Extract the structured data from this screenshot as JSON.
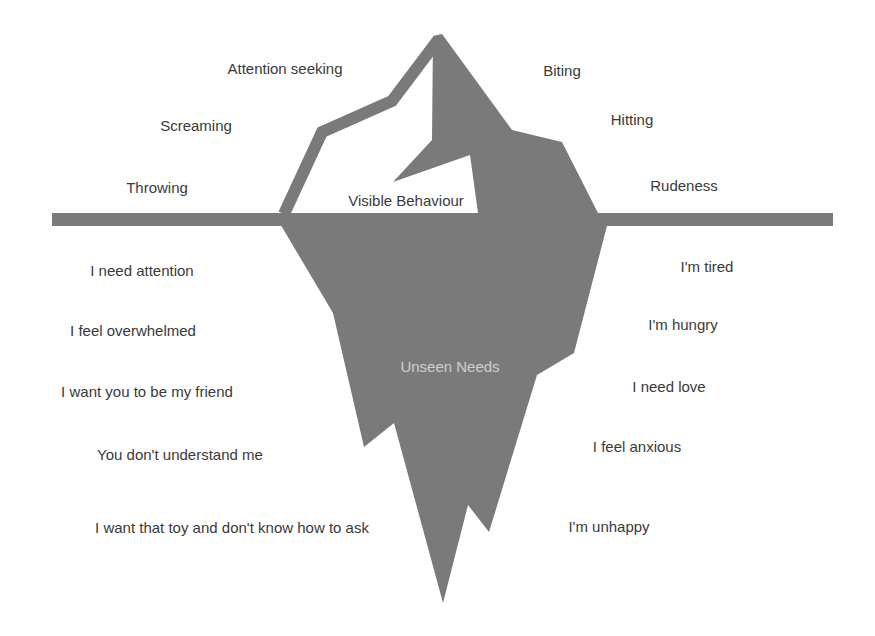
{
  "diagram": {
    "type": "iceberg",
    "colors": {
      "iceberg": "#7a7a7a",
      "waterline": "#7a7a7a",
      "text": "#3a3a3a",
      "unseen_text": "#cfcfcf",
      "background": "#ffffff"
    },
    "above_label": "Visible Behaviour",
    "below_label": "Unseen Needs",
    "visible_behaviours": {
      "left": [
        {
          "text": "Attention seeking",
          "x": 285,
          "y": 60
        },
        {
          "text": "Screaming",
          "x": 196,
          "y": 117
        },
        {
          "text": "Throwing",
          "x": 157,
          "y": 179
        }
      ],
      "right": [
        {
          "text": "Biting",
          "x": 562,
          "y": 62
        },
        {
          "text": "Hitting",
          "x": 632,
          "y": 111
        },
        {
          "text": "Rudeness",
          "x": 684,
          "y": 177
        }
      ]
    },
    "unseen_needs": {
      "left": [
        {
          "text": "I need attention",
          "x": 142,
          "y": 262
        },
        {
          "text": "I feel overwhelmed",
          "x": 133,
          "y": 322
        },
        {
          "text": "I want you to be my friend",
          "x": 147,
          "y": 383
        },
        {
          "text": "You don't understand me",
          "x": 180,
          "y": 446
        },
        {
          "text": "I want that toy and don't know how to ask",
          "x": 232,
          "y": 519
        }
      ],
      "right": [
        {
          "text": "I'm tired",
          "x": 707,
          "y": 258
        },
        {
          "text": "I'm hungry",
          "x": 683,
          "y": 316
        },
        {
          "text": "I need love",
          "x": 669,
          "y": 378
        },
        {
          "text": "I feel anxious",
          "x": 637,
          "y": 438
        },
        {
          "text": "I'm unhappy",
          "x": 609,
          "y": 518
        }
      ]
    }
  }
}
